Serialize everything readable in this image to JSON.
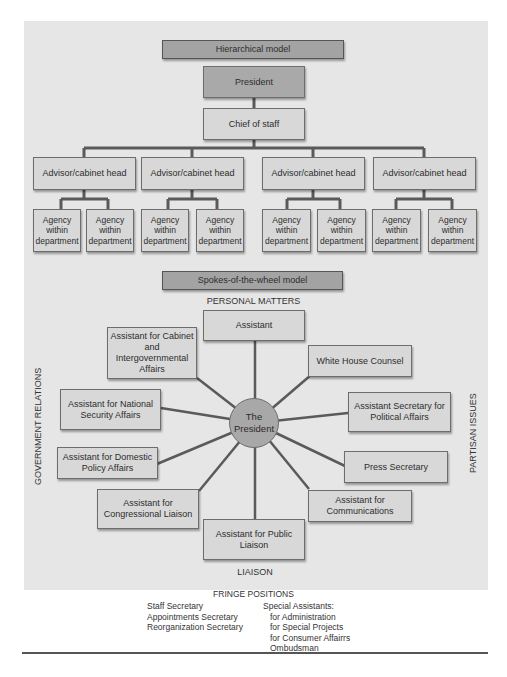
{
  "hierarchical": {
    "title": "Hierarchical model",
    "president": "President",
    "chief_of_staff": "Chief of staff",
    "advisors": [
      {
        "label": "Advisor/cabinet head",
        "agencies": [
          "Agency within department",
          "Agency within department"
        ]
      },
      {
        "label": "Advisor/cabinet head",
        "agencies": [
          "Agency within department",
          "Agency within department"
        ]
      },
      {
        "label": "Advisor/cabinet head",
        "agencies": [
          "Agency within department",
          "Agency within department"
        ]
      },
      {
        "label": "Advisor/cabinet head",
        "agencies": [
          "Agency within department",
          "Agency within department"
        ]
      }
    ]
  },
  "spokes": {
    "title": "Spokes-of-the-wheel model",
    "center": "The President",
    "region_labels": {
      "top": "PERSONAL MATTERS",
      "bottom": "LIAISON",
      "left": "GOVERNMENT RELATIONS",
      "right": "PARTISAN ISSUES"
    },
    "nodes": [
      {
        "id": "assistant",
        "label": "Assistant"
      },
      {
        "id": "white-house-counsel",
        "label": "White House Counsel"
      },
      {
        "id": "asst-sec-political",
        "label": "Assistant Secretary for Political Affairs"
      },
      {
        "id": "press-secretary",
        "label": "Press Secretary"
      },
      {
        "id": "asst-communications",
        "label": "Assistant for Communications"
      },
      {
        "id": "asst-public-liaison",
        "label": "Assistant for Public Liaison"
      },
      {
        "id": "asst-congressional",
        "label": "Assistant for Congressional Liaison"
      },
      {
        "id": "asst-domestic-policy",
        "label": "Assistant for Domestic Policy Affairs"
      },
      {
        "id": "asst-national-security",
        "label": "Assistant for National Security Affairs"
      },
      {
        "id": "asst-cabinet",
        "label": "Assistant for Cabinet and Intergovernmental Affairs"
      }
    ]
  },
  "fringe": {
    "title": "FRINGE POSITIONS",
    "left_column": [
      "Staff Secretary",
      "Appointments Secretary",
      "Reorganization Secretary"
    ],
    "right_column": [
      "Special Assistants:",
      "for Administration",
      "for Special Projects",
      "for Consumer Affairrs",
      "Ombudsman"
    ]
  },
  "colors": {
    "panel": "#e6e6e6",
    "box": "#d8d8d8",
    "box_dark": "#a9a9a9",
    "line": "#555555"
  }
}
